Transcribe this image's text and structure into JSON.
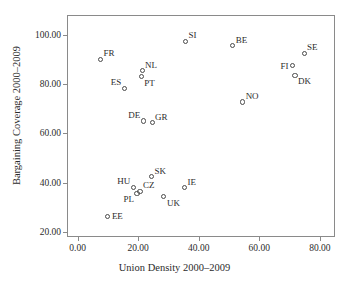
{
  "chart_data": {
    "type": "scatter",
    "title": "",
    "xlabel": "Union Density 2000–2009",
    "ylabel": "Bargaining Coverage 2000–2009",
    "xlim": [
      -3.5,
      85.0
    ],
    "ylim": [
      18.0,
      108.0
    ],
    "xticks": [
      0,
      20,
      40,
      60,
      80
    ],
    "xtick_labels": [
      "0.00",
      "20.00",
      "40.00",
      "60.00",
      "80.00"
    ],
    "yticks": [
      20,
      40,
      60,
      80,
      100
    ],
    "ytick_labels": [
      "20.00",
      "40.00",
      "60.00",
      "80.00",
      "100.00"
    ],
    "grid": false,
    "legend": "none",
    "marker_style": "open-circle",
    "marker_color": "#4a4a4a",
    "points": [
      {
        "label": "FR",
        "x": 7.6,
        "y": 90.0,
        "label_pos": "ne"
      },
      {
        "label": "SI",
        "x": 35.6,
        "y": 97.3,
        "label_pos": "ne"
      },
      {
        "label": "BE",
        "x": 51.2,
        "y": 95.5,
        "label_pos": "ne"
      },
      {
        "label": "SE",
        "x": 74.8,
        "y": 92.5,
        "label_pos": "ne"
      },
      {
        "label": "FI",
        "x": 71.0,
        "y": 87.5,
        "label_pos": "left"
      },
      {
        "label": "NL",
        "x": 21.3,
        "y": 85.5,
        "label_pos": "ne"
      },
      {
        "label": "PT",
        "x": 21.0,
        "y": 83.0,
        "label_pos": "se"
      },
      {
        "label": "DK",
        "x": 71.8,
        "y": 83.5,
        "label_pos": "se"
      },
      {
        "label": "ES",
        "x": 15.4,
        "y": 78.3,
        "label_pos": "nw"
      },
      {
        "label": "NO",
        "x": 54.5,
        "y": 72.7,
        "label_pos": "ne"
      },
      {
        "label": "DE",
        "x": 21.7,
        "y": 65.0,
        "label_pos": "nw"
      },
      {
        "label": "GR",
        "x": 24.6,
        "y": 64.3,
        "label_pos": "ne"
      },
      {
        "label": "SK",
        "x": 24.4,
        "y": 42.4,
        "label_pos": "ne"
      },
      {
        "label": "HU",
        "x": 18.4,
        "y": 38.1,
        "label_pos": "nw"
      },
      {
        "label": "IE",
        "x": 35.3,
        "y": 38.0,
        "label_pos": "ne"
      },
      {
        "label": "CZ",
        "x": 20.6,
        "y": 36.5,
        "label_pos": "ne"
      },
      {
        "label": "PL",
        "x": 19.6,
        "y": 35.7,
        "label_pos": "sw"
      },
      {
        "label": "UK",
        "x": 28.5,
        "y": 34.3,
        "label_pos": "se"
      },
      {
        "label": "EE",
        "x": 10.0,
        "y": 26.4,
        "label_pos": "right"
      }
    ]
  }
}
